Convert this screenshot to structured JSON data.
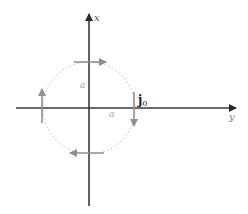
{
  "diagram": {
    "axes": {
      "vertical_label": "x",
      "horizontal_label": "y"
    },
    "circle": {
      "radius_label_vertical": "a",
      "radius_label_horizontal": "a",
      "style": "dashed"
    },
    "current": {
      "label_main": "j",
      "label_sub": "0",
      "direction": "clockwise"
    },
    "colors": {
      "axis": "#3a3a3a",
      "circle": "#c8c8c8",
      "current_arrows": "#909090",
      "labels_light": "#a0a0a0",
      "labels_dark": "#222222"
    }
  }
}
